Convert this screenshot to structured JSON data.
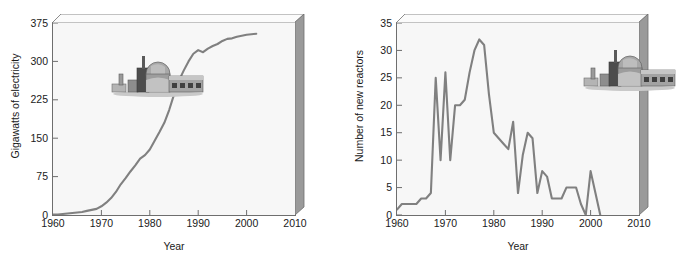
{
  "figure": {
    "panels": [
      {
        "id": "installed-capacity",
        "ylabel": "Gigawatts of electricity",
        "xlabel": "Year",
        "icon_name": "nuclear-power-plant-icon"
      },
      {
        "id": "new-reactors",
        "ylabel": "Number of new reactors",
        "xlabel": "Year",
        "icon_name": "nuclear-power-plant-icon"
      }
    ],
    "colors": {
      "line": "#808080",
      "plot_background": "#f7f7f7",
      "frame": "#6e6e6e",
      "bevel_shadow": "#8a8a8a",
      "text": "#1a1a1a"
    }
  },
  "chart_data": [
    {
      "type": "line",
      "title": "",
      "xlabel": "Year",
      "ylabel": "Gigawatts of electricity",
      "xlim": [
        1960,
        2010
      ],
      "ylim": [
        0,
        375
      ],
      "xticks": [
        1960,
        1970,
        1980,
        1990,
        2000,
        2010
      ],
      "xticklabels": [
        "1960",
        "1970",
        "1980",
        "1990",
        "2000",
        "2010"
      ],
      "yticks": [
        0,
        75,
        150,
        225,
        300,
        375
      ],
      "yticklabels": [
        "0",
        "75",
        "150",
        "225",
        "300",
        "375"
      ],
      "grid": false,
      "legend": null,
      "series": [
        {
          "name": "Installed nuclear electricity capacity",
          "x": [
            1960,
            1961,
            1962,
            1963,
            1964,
            1965,
            1966,
            1967,
            1968,
            1969,
            1970,
            1971,
            1972,
            1973,
            1974,
            1975,
            1976,
            1977,
            1978,
            1979,
            1980,
            1981,
            1982,
            1983,
            1984,
            1985,
            1986,
            1987,
            1988,
            1989,
            1990,
            1991,
            1992,
            1993,
            1994,
            1995,
            1996,
            1997,
            1998,
            1999,
            2000,
            2001,
            2002
          ],
          "values": [
            1,
            1,
            2,
            3,
            4,
            5,
            6,
            8,
            10,
            12,
            17,
            24,
            33,
            45,
            60,
            72,
            85,
            97,
            110,
            117,
            128,
            145,
            162,
            180,
            205,
            235,
            262,
            282,
            300,
            315,
            322,
            318,
            325,
            330,
            334,
            340,
            344,
            345,
            348,
            350,
            352,
            353,
            354
          ]
        }
      ]
    },
    {
      "type": "line",
      "title": "",
      "xlabel": "Year",
      "ylabel": "Number of new reactors",
      "xlim": [
        1960,
        2010
      ],
      "ylim": [
        0,
        35
      ],
      "xticks": [
        1960,
        1970,
        1980,
        1990,
        2000,
        2010
      ],
      "xticklabels": [
        "1960",
        "1970",
        "1980",
        "1990",
        "2000",
        "2010"
      ],
      "yticks": [
        0,
        5,
        10,
        15,
        20,
        25,
        30,
        35
      ],
      "yticklabels": [
        "0",
        "5",
        "10",
        "15",
        "20",
        "25",
        "30",
        "35"
      ],
      "grid": false,
      "legend": null,
      "series": [
        {
          "name": "New reactors connected to the grid",
          "x": [
            1960,
            1961,
            1962,
            1963,
            1964,
            1965,
            1966,
            1967,
            1968,
            1969,
            1970,
            1971,
            1972,
            1973,
            1974,
            1975,
            1976,
            1977,
            1978,
            1979,
            1980,
            1981,
            1982,
            1983,
            1984,
            1985,
            1986,
            1987,
            1988,
            1989,
            1990,
            1991,
            1992,
            1993,
            1994,
            1995,
            1996,
            1997,
            1998,
            1999,
            2000,
            2001,
            2002
          ],
          "values": [
            1,
            2,
            2,
            2,
            2,
            3,
            3,
            4,
            25,
            10,
            26,
            10,
            20,
            20,
            21,
            26,
            30,
            32,
            31,
            22,
            15,
            14,
            13,
            12,
            17,
            4,
            11,
            15,
            14,
            4,
            8,
            7,
            3,
            3,
            3,
            5,
            5,
            5,
            2,
            0,
            8,
            4,
            0
          ]
        }
      ]
    }
  ]
}
